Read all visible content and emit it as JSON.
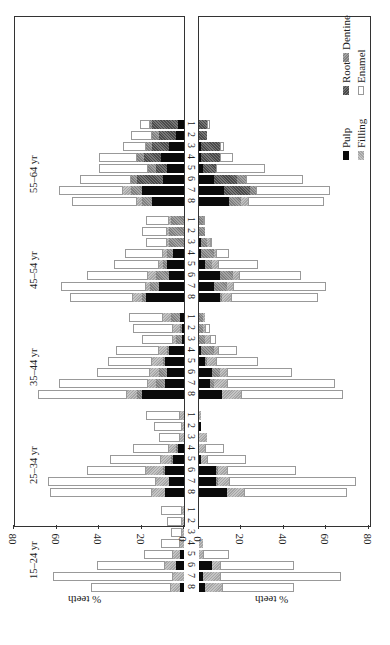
{
  "chart_data": {
    "type": "bar",
    "orientation": "rotated-90 stacked horizontal bars, mirrored panels",
    "title": "",
    "xlabel": "% teeth",
    "ylabel": "",
    "xlim": [
      0,
      80
    ],
    "x_ticks": [
      "0",
      "20",
      "40",
      "60",
      "80"
    ],
    "tooth_positions": [
      "1",
      "2",
      "3",
      "4",
      "5",
      "6",
      "7",
      "8"
    ],
    "age_groups": [
      "15–24 yr",
      "25–34 yr",
      "35–44 yr",
      "45–54 yr",
      "55–64 yr"
    ],
    "legend": [
      {
        "name": "Pulp",
        "key": "pulp"
      },
      {
        "name": "Root",
        "key": "root"
      },
      {
        "name": "Dentine",
        "key": "dentine"
      },
      {
        "name": "Filling",
        "key": "filling"
      },
      {
        "name": "Enamel",
        "key": "enamel"
      }
    ],
    "panels": [
      {
        "name": "upper",
        "groups": [
          {
            "age": "55–64 yr",
            "teeth": [
              {
                "tooth": "8",
                "pulp": 15,
                "root": 0,
                "dentine": 5,
                "filling": 2,
                "enamel": 31
              },
              {
                "tooth": "7",
                "pulp": 20,
                "root": 0,
                "dentine": 5,
                "filling": 4,
                "enamel": 30
              },
              {
                "tooth": "6",
                "pulp": 10,
                "root": 12,
                "dentine": 3,
                "filling": 0,
                "enamel": 24
              },
              {
                "tooth": "5",
                "pulp": 8,
                "root": 5,
                "dentine": 4,
                "filling": 0,
                "enamel": 23
              },
              {
                "tooth": "4",
                "pulp": 11,
                "root": 8,
                "dentine": 3,
                "filling": 0,
                "enamel": 18
              },
              {
                "tooth": "3",
                "pulp": 7,
                "root": 8,
                "dentine": 3,
                "filling": 0,
                "enamel": 11
              },
              {
                "tooth": "2",
                "pulp": 4,
                "root": 8,
                "dentine": 3,
                "filling": 0,
                "enamel": 10
              },
              {
                "tooth": "1",
                "pulp": 3,
                "root": 12,
                "dentine": 1,
                "filling": 0,
                "enamel": 5
              }
            ]
          },
          {
            "age": "45–54 yr",
            "teeth": [
              {
                "tooth": "8",
                "pulp": 18,
                "root": 0,
                "dentine": 2,
                "filling": 4,
                "enamel": 30
              },
              {
                "tooth": "7",
                "pulp": 12,
                "root": 0,
                "dentine": 4,
                "filling": 2,
                "enamel": 40
              },
              {
                "tooth": "6",
                "pulp": 7,
                "root": 0,
                "dentine": 6,
                "filling": 4,
                "enamel": 29
              },
              {
                "tooth": "5",
                "pulp": 8,
                "root": 0,
                "dentine": 2,
                "filling": 2,
                "enamel": 21
              },
              {
                "tooth": "4",
                "pulp": 5,
                "root": 0,
                "dentine": 3,
                "filling": 2,
                "enamel": 18
              },
              {
                "tooth": "3",
                "pulp": 0,
                "root": 0,
                "dentine": 7,
                "filling": 1,
                "enamel": 10
              },
              {
                "tooth": "2",
                "pulp": 0,
                "root": 0,
                "dentine": 7,
                "filling": 1,
                "enamel": 12
              },
              {
                "tooth": "1",
                "pulp": 0,
                "root": 0,
                "dentine": 6,
                "filling": 1,
                "enamel": 11
              }
            ]
          },
          {
            "age": "35–44 yr",
            "teeth": [
              {
                "tooth": "8",
                "pulp": 20,
                "root": 0,
                "dentine": 2,
                "filling": 5,
                "enamel": 42
              },
              {
                "tooth": "7",
                "pulp": 9,
                "root": 0,
                "dentine": 4,
                "filling": 4,
                "enamel": 42
              },
              {
                "tooth": "6",
                "pulp": 8,
                "root": 0,
                "dentine": 4,
                "filling": 4,
                "enamel": 25
              },
              {
                "tooth": "5",
                "pulp": 9,
                "root": 0,
                "dentine": 1,
                "filling": 5,
                "enamel": 21
              },
              {
                "tooth": "4",
                "pulp": 7,
                "root": 0,
                "dentine": 1,
                "filling": 4,
                "enamel": 20
              },
              {
                "tooth": "3",
                "pulp": 1,
                "root": 0,
                "dentine": 3,
                "filling": 1,
                "enamel": 15
              },
              {
                "tooth": "2",
                "pulp": 1,
                "root": 0,
                "dentine": 1,
                "filling": 3,
                "enamel": 19
              },
              {
                "tooth": "1",
                "pulp": 2,
                "root": 0,
                "dentine": 4,
                "filling": 4,
                "enamel": 16
              }
            ]
          },
          {
            "age": "25–34 yr",
            "teeth": [
              {
                "tooth": "8",
                "pulp": 9,
                "root": 0,
                "dentine": 0,
                "filling": 6,
                "enamel": 48
              },
              {
                "tooth": "7",
                "pulp": 7,
                "root": 0,
                "dentine": 0,
                "filling": 6,
                "enamel": 51
              },
              {
                "tooth": "6",
                "pulp": 9,
                "root": 0,
                "dentine": 1,
                "filling": 8,
                "enamel": 28
              },
              {
                "tooth": "5",
                "pulp": 5,
                "root": 0,
                "dentine": 1,
                "filling": 5,
                "enamel": 24
              },
              {
                "tooth": "4",
                "pulp": 3,
                "root": 0,
                "dentine": 1,
                "filling": 3,
                "enamel": 17
              },
              {
                "tooth": "3",
                "pulp": 0,
                "root": 0,
                "dentine": 0,
                "filling": 2,
                "enamel": 10
              },
              {
                "tooth": "2",
                "pulp": 0,
                "root": 0,
                "dentine": 0,
                "filling": 1,
                "enamel": 13
              },
              {
                "tooth": "1",
                "pulp": 0,
                "root": 0,
                "dentine": 0,
                "filling": 2,
                "enamel": 16
              }
            ]
          },
          {
            "age": "15–24 yr",
            "teeth": [
              {
                "tooth": "8",
                "pulp": 2,
                "root": 0,
                "dentine": 0,
                "filling": 4,
                "enamel": 38
              },
              {
                "tooth": "7",
                "pulp": 0,
                "root": 0,
                "dentine": 0,
                "filling": 5,
                "enamel": 57
              },
              {
                "tooth": "6",
                "pulp": 4,
                "root": 0,
                "dentine": 0,
                "filling": 5,
                "enamel": 32
              },
              {
                "tooth": "5",
                "pulp": 2,
                "root": 0,
                "dentine": 0,
                "filling": 3,
                "enamel": 14
              },
              {
                "tooth": "4",
                "pulp": 0,
                "root": 0,
                "dentine": 0,
                "filling": 2,
                "enamel": 9
              },
              {
                "tooth": "3",
                "pulp": 0,
                "root": 0,
                "dentine": 0,
                "filling": 1,
                "enamel": 5
              },
              {
                "tooth": "2",
                "pulp": 0,
                "root": 0,
                "dentine": 0,
                "filling": 1,
                "enamel": 7
              },
              {
                "tooth": "1",
                "pulp": 0,
                "root": 0,
                "dentine": 0,
                "filling": 1,
                "enamel": 10
              }
            ]
          }
        ]
      },
      {
        "name": "lower",
        "groups": [
          {
            "age": "55–64 yr",
            "teeth": [
              {
                "tooth": "8",
                "pulp": 14,
                "root": 0,
                "dentine": 6,
                "filling": 3,
                "enamel": 36
              },
              {
                "tooth": "7",
                "pulp": 12,
                "root": 12,
                "dentine": 3,
                "filling": 0,
                "enamel": 35
              },
              {
                "tooth": "6",
                "pulp": 7,
                "root": 11,
                "dentine": 4,
                "filling": 0,
                "enamel": 27
              },
              {
                "tooth": "5",
                "pulp": 2,
                "root": 6,
                "dentine": 0,
                "filling": 0,
                "enamel": 23
              },
              {
                "tooth": "4",
                "pulp": 1,
                "root": 9,
                "dentine": 0,
                "filling": 0,
                "enamel": 6
              },
              {
                "tooth": "3",
                "pulp": 1,
                "root": 9,
                "dentine": 0,
                "filling": 0,
                "enamel": 2
              },
              {
                "tooth": "2",
                "pulp": 0,
                "root": 4,
                "dentine": 0,
                "filling": 0,
                "enamel": 0
              },
              {
                "tooth": "1",
                "pulp": 0,
                "root": 4,
                "dentine": 0,
                "filling": 0,
                "enamel": 1
              }
            ]
          },
          {
            "age": "45–54 yr",
            "teeth": [
              {
                "tooth": "8",
                "pulp": 10,
                "root": 0,
                "dentine": 1,
                "filling": 4,
                "enamel": 41
              },
              {
                "tooth": "7",
                "pulp": 7,
                "root": 0,
                "dentine": 6,
                "filling": 3,
                "enamel": 44
              },
              {
                "tooth": "6",
                "pulp": 10,
                "root": 0,
                "dentine": 6,
                "filling": 3,
                "enamel": 29
              },
              {
                "tooth": "5",
                "pulp": 3,
                "root": 0,
                "dentine": 3,
                "filling": 3,
                "enamel": 19
              },
              {
                "tooth": "4",
                "pulp": 1,
                "root": 0,
                "dentine": 6,
                "filling": 1,
                "enamel": 6
              },
              {
                "tooth": "3",
                "pulp": 1,
                "root": 0,
                "dentine": 3,
                "filling": 1,
                "enamel": 1
              },
              {
                "tooth": "2",
                "pulp": 0,
                "root": 0,
                "dentine": 3,
                "filling": 0,
                "enamel": 0
              },
              {
                "tooth": "1",
                "pulp": 0,
                "root": 0,
                "dentine": 2,
                "filling": 0,
                "enamel": 1
              }
            ]
          },
          {
            "age": "35–44 yr",
            "teeth": [
              {
                "tooth": "8",
                "pulp": 11,
                "root": 0,
                "dentine": 0,
                "filling": 9,
                "enamel": 48
              },
              {
                "tooth": "7",
                "pulp": 5,
                "root": 0,
                "dentine": 2,
                "filling": 6,
                "enamel": 51
              },
              {
                "tooth": "6",
                "pulp": 6,
                "root": 0,
                "dentine": 4,
                "filling": 3,
                "enamel": 31
              },
              {
                "tooth": "5",
                "pulp": 3,
                "root": 0,
                "dentine": 1,
                "filling": 4,
                "enamel": 20
              },
              {
                "tooth": "4",
                "pulp": 1,
                "root": 0,
                "dentine": 6,
                "filling": 2,
                "enamel": 9
              },
              {
                "tooth": "3",
                "pulp": 0,
                "root": 0,
                "dentine": 3,
                "filling": 2,
                "enamel": 3
              },
              {
                "tooth": "2",
                "pulp": 0,
                "root": 0,
                "dentine": 2,
                "filling": 1,
                "enamel": 2
              },
              {
                "tooth": "1",
                "pulp": 0,
                "root": 0,
                "dentine": 2,
                "filling": 1,
                "enamel": 0
              }
            ]
          },
          {
            "age": "25–34 yr",
            "teeth": [
              {
                "tooth": "8",
                "pulp": 13,
                "root": 0,
                "dentine": 0,
                "filling": 8,
                "enamel": 49
              },
              {
                "tooth": "7",
                "pulp": 8,
                "root": 0,
                "dentine": 1,
                "filling": 5,
                "enamel": 60
              },
              {
                "tooth": "6",
                "pulp": 8,
                "root": 0,
                "dentine": 1,
                "filling": 4,
                "enamel": 33
              },
              {
                "tooth": "5",
                "pulp": 1,
                "root": 0,
                "dentine": 0,
                "filling": 3,
                "enamel": 18
              },
              {
                "tooth": "4",
                "pulp": 0,
                "root": 0,
                "dentine": 0,
                "filling": 3,
                "enamel": 9
              },
              {
                "tooth": "3",
                "pulp": 0,
                "root": 0,
                "dentine": 0,
                "filling": 4,
                "enamel": 0
              },
              {
                "tooth": "2",
                "pulp": 1,
                "root": 0,
                "dentine": 0,
                "filling": 0,
                "enamel": 0
              },
              {
                "tooth": "1",
                "pulp": 0,
                "root": 0,
                "dentine": 0,
                "filling": 1,
                "enamel": 0
              }
            ]
          },
          {
            "age": "15–24 yr",
            "teeth": [
              {
                "tooth": "8",
                "pulp": 3,
                "root": 0,
                "dentine": 0,
                "filling": 8,
                "enamel": 34
              },
              {
                "tooth": "7",
                "pulp": 2,
                "root": 0,
                "dentine": 0,
                "filling": 8,
                "enamel": 57
              },
              {
                "tooth": "6",
                "pulp": 6,
                "root": 0,
                "dentine": 0,
                "filling": 4,
                "enamel": 35
              },
              {
                "tooth": "5",
                "pulp": 0,
                "root": 0,
                "dentine": 0,
                "filling": 2,
                "enamel": 12
              },
              {
                "tooth": "4",
                "pulp": 0,
                "root": 0,
                "dentine": 0,
                "filling": 2,
                "enamel": 0
              },
              {
                "tooth": "3",
                "pulp": 0,
                "root": 0,
                "dentine": 0,
                "filling": 0,
                "enamel": 0
              },
              {
                "tooth": "2",
                "pulp": 0,
                "root": 0,
                "dentine": 0,
                "filling": 0,
                "enamel": 0
              },
              {
                "tooth": "1",
                "pulp": 0,
                "root": 0,
                "dentine": 0,
                "filling": 0,
                "enamel": 0
              }
            ]
          }
        ]
      }
    ],
    "grid": false,
    "legend_position": "top-right (rotated)"
  },
  "axis": {
    "title": "% teeth",
    "ticks_upper": [
      "80",
      "60",
      "40",
      "20",
      "0"
    ],
    "ticks_lower": [
      "0",
      "20",
      "40",
      "60",
      "80"
    ]
  },
  "legend": {
    "pulp": "Pulp",
    "root": "Root",
    "dentine": "Dentine",
    "filling": "Filling",
    "enamel": "Enamel"
  }
}
